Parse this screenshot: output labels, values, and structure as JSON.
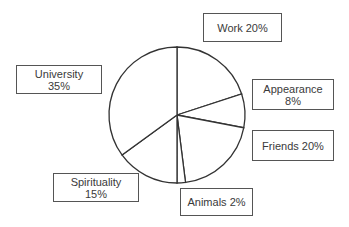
{
  "chart_data": {
    "type": "pie",
    "title": "",
    "start": "top",
    "direction": "clockwise",
    "slices": [
      {
        "name": "Work",
        "value": 20,
        "label": "Work 20%"
      },
      {
        "name": "Appearance",
        "value": 8,
        "label_lines": [
          "Appearance",
          "8%"
        ]
      },
      {
        "name": "Friends",
        "value": 20,
        "label": "Friends 20%"
      },
      {
        "name": "Animals",
        "value": 2,
        "label": "Animals 2%"
      },
      {
        "name": "Spirituality",
        "value": 15,
        "label_lines": [
          "Spirituality",
          "15%"
        ]
      },
      {
        "name": "University",
        "value": 35,
        "label_lines": [
          "University",
          "35%"
        ]
      }
    ],
    "unit": "%",
    "fill_color": "#ffffff",
    "stroke_color": "#333333",
    "legend": "none"
  }
}
